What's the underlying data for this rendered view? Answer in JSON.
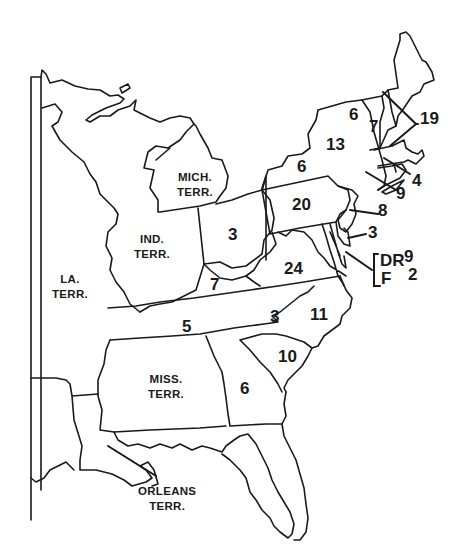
{
  "map": {
    "territories": [
      {
        "id": "mich",
        "line1": "MICH.",
        "line2": "TERR."
      },
      {
        "id": "ind",
        "line1": "IND.",
        "line2": "TERR."
      },
      {
        "id": "la",
        "line1": "LA.",
        "line2": "TERR."
      },
      {
        "id": "miss",
        "line1": "MISS.",
        "line2": "TERR."
      },
      {
        "id": "orleans",
        "line1": "ORLEANS",
        "line2": "TERR."
      }
    ],
    "states": [
      {
        "name": "Vermont",
        "value": "6"
      },
      {
        "name": "New Hampshire",
        "value": "7"
      },
      {
        "name": "Massachusetts",
        "value": "19"
      },
      {
        "name": "New York",
        "value": "13"
      },
      {
        "name": "New York (west)",
        "value": "6"
      },
      {
        "name": "Rhode Island",
        "value": "4"
      },
      {
        "name": "Connecticut",
        "value": "9"
      },
      {
        "name": "New Jersey",
        "value": "8"
      },
      {
        "name": "Pennsylvania",
        "value": "20"
      },
      {
        "name": "Delaware",
        "value": "3"
      },
      {
        "name": "Ohio",
        "value": "3"
      },
      {
        "name": "Virginia",
        "value": "24"
      },
      {
        "name": "Kentucky",
        "value": "7"
      },
      {
        "name": "Tennessee",
        "value": "5"
      },
      {
        "name": "North Carolina (west)",
        "value": "3"
      },
      {
        "name": "North Carolina",
        "value": "11"
      },
      {
        "name": "South Carolina",
        "value": "10"
      },
      {
        "name": "Georgia",
        "value": "6"
      }
    ],
    "legend_bracket": {
      "row1_label": "DR",
      "row1_value": "9",
      "row2_label": "F",
      "row2_value": "2"
    },
    "colors": {
      "ink": "#1a1a1a",
      "background": "#ffffff"
    }
  }
}
